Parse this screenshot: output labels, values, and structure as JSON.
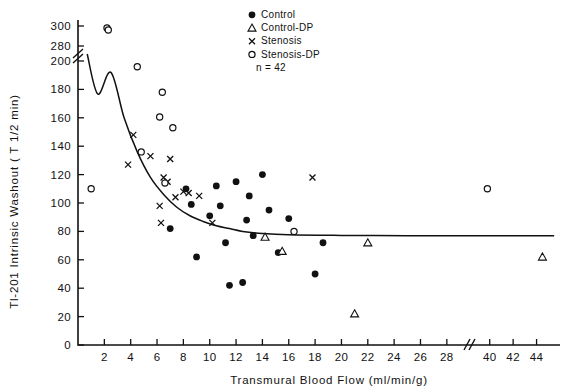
{
  "chart_data": {
    "type": "scatter",
    "title": "",
    "xlabel": "Transmural Blood Flow (ml/min/g)",
    "ylabel": "Tl-201 Intrinsic Washout ( T 1/2 min)",
    "xlim": [
      0,
      4.6
    ],
    "ylim": [
      0,
      300
    ],
    "grid": false,
    "legend_position": "top-center",
    "x_axis_break": {
      "from": 2.9,
      "to": 3.9,
      "symbol": "//"
    },
    "y_axis_break": {
      "from": 200,
      "to": 280,
      "symbol": "//"
    },
    "xticks": [
      0.2,
      0.4,
      0.6,
      0.8,
      1.0,
      1.2,
      1.4,
      1.6,
      1.8,
      2.0,
      2.2,
      2.4,
      2.6,
      2.8,
      4.0,
      4.2,
      4.4
    ],
    "xticklabels": [
      "2",
      "4",
      "6",
      "8",
      "10",
      "12",
      "14",
      "16",
      "18",
      "20",
      "22",
      "24",
      "26",
      "28",
      "40",
      "42",
      "44"
    ],
    "yticks": [
      0,
      20,
      40,
      60,
      80,
      100,
      120,
      140,
      160,
      180,
      200,
      280,
      300
    ],
    "yticklabels": [
      "0",
      "20",
      "40",
      "60",
      "80",
      "100",
      "120",
      "140",
      "160",
      "180",
      "200",
      "280",
      "300"
    ],
    "annotation_n": "n = 42",
    "series": [
      {
        "name": "Control",
        "marker": "filled-circle",
        "color": "#111111",
        "points": [
          [
            0.7,
            82
          ],
          [
            0.82,
            110
          ],
          [
            0.86,
            99
          ],
          [
            0.9,
            62
          ],
          [
            1.0,
            91
          ],
          [
            1.05,
            112
          ],
          [
            1.08,
            98
          ],
          [
            1.12,
            72
          ],
          [
            1.15,
            42
          ],
          [
            1.2,
            115
          ],
          [
            1.25,
            44
          ],
          [
            1.28,
            88
          ],
          [
            1.3,
            105
          ],
          [
            1.33,
            77
          ],
          [
            1.4,
            120
          ],
          [
            1.45,
            95
          ],
          [
            1.52,
            65
          ],
          [
            1.6,
            89
          ],
          [
            1.8,
            50
          ],
          [
            1.86,
            72
          ]
        ]
      },
      {
        "name": "Control-DP",
        "marker": "open-triangle",
        "color": "#111111",
        "points": [
          [
            1.42,
            76
          ],
          [
            1.55,
            66
          ],
          [
            2.1,
            22
          ],
          [
            2.2,
            72
          ],
          [
            4.45,
            62
          ]
        ]
      },
      {
        "name": "Stenosis",
        "marker": "x",
        "color": "#111111",
        "points": [
          [
            0.38,
            127
          ],
          [
            0.42,
            148
          ],
          [
            0.55,
            133
          ],
          [
            0.62,
            98
          ],
          [
            0.63,
            86
          ],
          [
            0.65,
            118
          ],
          [
            0.68,
            115
          ],
          [
            0.7,
            131
          ],
          [
            0.74,
            104
          ],
          [
            0.8,
            108
          ],
          [
            0.84,
            107
          ],
          [
            0.92,
            105
          ],
          [
            1.02,
            86
          ],
          [
            1.78,
            118
          ]
        ]
      },
      {
        "name": "Stenosis-DP",
        "marker": "open-circle",
        "color": "#111111",
        "points": [
          [
            0.1,
            110
          ],
          [
            0.22,
            298
          ],
          [
            0.23,
            296
          ],
          [
            0.45,
            196
          ],
          [
            0.48,
            136
          ],
          [
            0.62,
            209
          ],
          [
            0.64,
            178
          ],
          [
            0.72,
            153
          ],
          [
            0.66,
            114
          ],
          [
            1.64,
            80
          ],
          [
            3.98,
            110
          ]
        ]
      }
    ],
    "fit_curve": {
      "description": "monoexponential decay fit approaching asymptote ~77",
      "asymptote": 77,
      "points": [
        [
          0.07,
          272
        ],
        [
          0.15,
          232
        ],
        [
          0.25,
          192
        ],
        [
          0.35,
          160
        ],
        [
          0.45,
          136
        ],
        [
          0.55,
          118
        ],
        [
          0.65,
          106
        ],
        [
          0.75,
          97
        ],
        [
          0.85,
          91
        ],
        [
          0.95,
          87
        ],
        [
          1.05,
          84
        ],
        [
          1.15,
          82
        ],
        [
          1.25,
          80
        ],
        [
          1.4,
          78.5
        ],
        [
          1.6,
          77.6
        ],
        [
          2.0,
          77.2
        ],
        [
          2.5,
          77.0
        ],
        [
          2.88,
          77.0
        ],
        [
          3.92,
          77.0
        ],
        [
          4.55,
          77.0
        ]
      ]
    },
    "legend": [
      {
        "label": "Control",
        "marker": "filled-circle"
      },
      {
        "label": "Control-DP",
        "marker": "open-triangle"
      },
      {
        "label": "Stenosis",
        "marker": "x"
      },
      {
        "label": "Stenosis-DP",
        "marker": "open-circle"
      },
      {
        "label": "n = 42",
        "marker": "none"
      }
    ]
  }
}
